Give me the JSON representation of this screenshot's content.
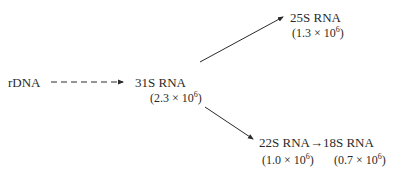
{
  "diagram": {
    "nodes": {
      "rdna": {
        "label": "rDNA"
      },
      "rna31": {
        "label": "31S RNA",
        "mw_prefix": "(2.3 × 10",
        "mw_exp": "6",
        "mw_suffix": ")"
      },
      "rna25": {
        "label": "25S RNA",
        "mw_prefix": "(1.3 × 10",
        "mw_exp": "6",
        "mw_suffix": ")"
      },
      "rna22": {
        "label": "22S RNA",
        "mw_prefix": "(1.0 × 10",
        "mw_exp": "6",
        "mw_suffix": ")"
      },
      "rna18": {
        "label": "18S RNA",
        "mw_prefix": "(0.7 × 10",
        "mw_exp": "6",
        "mw_suffix": ")"
      }
    },
    "edges": [
      {
        "from": "rDNA",
        "to": "31S RNA",
        "style": "dashed"
      },
      {
        "from": "31S RNA",
        "to": "25S RNA",
        "style": "solid"
      },
      {
        "from": "31S RNA",
        "to": "22S RNA",
        "style": "solid"
      },
      {
        "from": "22S RNA",
        "to": "18S RNA",
        "style": "solid-inline",
        "symbol": "→"
      }
    ],
    "colors": {
      "ink": "#2a2a2a",
      "background": "#ffffff"
    }
  }
}
